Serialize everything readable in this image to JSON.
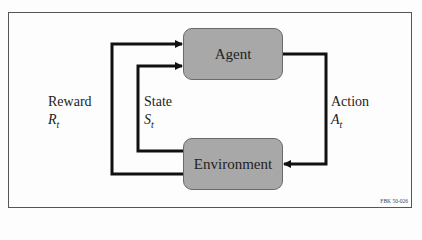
{
  "diagram": {
    "type": "reinforcement-learning-loop",
    "nodes": {
      "agent": {
        "label": "Agent"
      },
      "environment": {
        "label": "Environment"
      }
    },
    "edges": [
      {
        "from": "environment",
        "to": "agent",
        "label": "Reward",
        "symbol": "R",
        "subscript": "t"
      },
      {
        "from": "environment",
        "to": "agent",
        "label": "State",
        "symbol": "S",
        "subscript": "t"
      },
      {
        "from": "agent",
        "to": "environment",
        "label": "Action",
        "symbol": "A",
        "subscript": "t"
      }
    ],
    "figure_code": "FBK 50-026",
    "colors": {
      "box_fill": "#a8a8a8",
      "box_border": "#6a6a6a",
      "line": "#111111",
      "frame": "#555555"
    }
  }
}
